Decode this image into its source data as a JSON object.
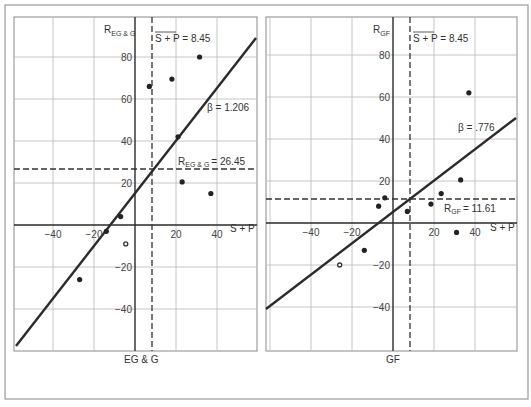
{
  "chart_data": [
    {
      "type": "scatter",
      "panel": "left",
      "title": "EG & G",
      "xlabel": "S + P",
      "ylabel": "R_EG&G",
      "ylabel_main": "R",
      "ylabel_sub": "EG & G",
      "xticks": [
        "-40",
        "-20",
        "20",
        "40"
      ],
      "yticks": [
        "80",
        "60",
        "40",
        "20",
        "-20",
        "-40"
      ],
      "xlim": [
        -60,
        60
      ],
      "ylim": [
        -60,
        100
      ],
      "grid": true,
      "mean_x_label": "S + P = 8.45",
      "mean_x": 8.45,
      "mean_y_label_main": "R",
      "mean_y_label_sub": "EG & G",
      "mean_y_label_value": "= 26.45",
      "mean_y": 26.45,
      "beta_label": "β = 1.206",
      "beta": 1.206,
      "points": [
        {
          "x": 7,
          "y": 66,
          "hollow": false
        },
        {
          "x": 18,
          "y": 69.5,
          "hollow": false
        },
        {
          "x": 31.5,
          "y": 80,
          "hollow": false
        },
        {
          "x": 21,
          "y": 42,
          "hollow": false
        },
        {
          "x": 23,
          "y": 20.5,
          "hollow": false
        },
        {
          "x": 37,
          "y": 15,
          "hollow": false
        },
        {
          "x": -7,
          "y": 4,
          "hollow": false
        },
        {
          "x": -14,
          "y": -3,
          "hollow": false
        },
        {
          "x": -4.5,
          "y": -9,
          "hollow": true
        },
        {
          "x": -27,
          "y": -26,
          "hollow": false
        }
      ]
    },
    {
      "type": "scatter",
      "panel": "right",
      "title": "GF",
      "xlabel": "S + P",
      "ylabel": "R_GF",
      "ylabel_main": "R",
      "ylabel_sub": "GF",
      "xticks": [
        "-40",
        "-20",
        "20",
        "40"
      ],
      "yticks": [
        "80",
        "60",
        "40",
        "20",
        "-20",
        "-40"
      ],
      "xlim": [
        -60,
        60
      ],
      "ylim": [
        -60,
        100
      ],
      "grid": true,
      "mean_x_label": "S + P = 8.45",
      "mean_x": 8.45,
      "mean_y_label_main": "R",
      "mean_y_label_sub": "GF",
      "mean_y_label_value": "= 11.61",
      "mean_y": 11.61,
      "beta_label": "β = .776",
      "beta": 0.776,
      "points": [
        {
          "x": 37,
          "y": 62,
          "hollow": false
        },
        {
          "x": 33,
          "y": 20.5,
          "hollow": false
        },
        {
          "x": 23.5,
          "y": 14,
          "hollow": false
        },
        {
          "x": 18.5,
          "y": 9,
          "hollow": false
        },
        {
          "x": 7,
          "y": 5.5,
          "hollow": false
        },
        {
          "x": -4,
          "y": 12,
          "hollow": false
        },
        {
          "x": -7,
          "y": 8,
          "hollow": false
        },
        {
          "x": 31,
          "y": -4.5,
          "hollow": false
        },
        {
          "x": -14,
          "y": -13,
          "hollow": false
        },
        {
          "x": -26,
          "y": -20,
          "hollow": true
        }
      ]
    }
  ]
}
